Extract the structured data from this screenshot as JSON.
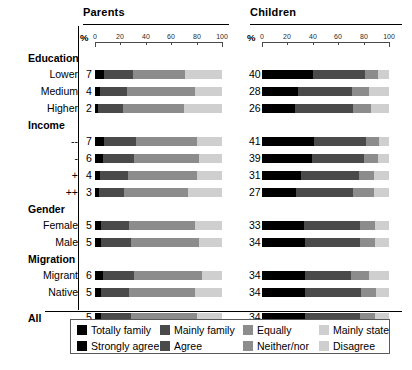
{
  "panels": [
    {
      "title": "Parents",
      "axis_unit": "%"
    },
    {
      "title": "Children",
      "axis_unit": "%"
    }
  ],
  "axis": {
    "unit": "%",
    "ticks": [
      0,
      20,
      40,
      60,
      80,
      100
    ],
    "tick_labels": [
      "0",
      "20",
      "40",
      "60",
      "80",
      "100"
    ],
    "min": 0,
    "max": 100
  },
  "legend": {
    "rows": [
      [
        {
          "label": "Totally family",
          "color": "#000000"
        },
        {
          "label": "Mainly family",
          "color": "#4a4a4a"
        },
        {
          "label": "Equally",
          "color": "#8c8c8c"
        },
        {
          "label": "Mainly state",
          "color": "#cfcfcf"
        }
      ],
      [
        {
          "label": "Strongly agree",
          "color": "#000000"
        },
        {
          "label": "Agree",
          "color": "#4a4a4a"
        },
        {
          "label": "Neither/nor",
          "color": "#8c8c8c"
        },
        {
          "label": "Disagree",
          "color": "#cfcfcf"
        }
      ]
    ]
  },
  "groups": [
    {
      "name": "Education",
      "rows": [
        {
          "label": "Lower",
          "parents_value": "7",
          "children_value": "40"
        },
        {
          "label": "Medium",
          "parents_value": "4",
          "children_value": "28"
        },
        {
          "label": "Higher",
          "parents_value": "2",
          "children_value": "26"
        }
      ]
    },
    {
      "name": "Income",
      "rows": [
        {
          "label": "--",
          "parents_value": "7",
          "children_value": "41"
        },
        {
          "label": "-",
          "parents_value": "6",
          "children_value": "39"
        },
        {
          "label": "+",
          "parents_value": "4",
          "children_value": "31"
        },
        {
          "label": "++",
          "parents_value": "3",
          "children_value": "27"
        }
      ]
    },
    {
      "name": "Gender",
      "rows": [
        {
          "label": "Female",
          "parents_value": "5",
          "children_value": "33"
        },
        {
          "label": "Male",
          "parents_value": "5",
          "children_value": "34"
        }
      ]
    },
    {
      "name": "Migration",
      "rows": [
        {
          "label": "Migrant",
          "parents_value": "6",
          "children_value": "34"
        },
        {
          "label": "Native",
          "parents_value": "5",
          "children_value": "34"
        }
      ]
    },
    {
      "name": "All",
      "is_total": true,
      "rows": [
        {
          "label": "",
          "parents_value": "5",
          "children_value": "34"
        }
      ]
    }
  ],
  "chart_data": {
    "type": "bar",
    "orientation": "horizontal",
    "stacked": true,
    "stack_mode": "percent",
    "title": "",
    "xlabel": "%",
    "ylabel": "",
    "xlim": [
      0,
      100
    ],
    "xticks": [
      0,
      20,
      40,
      60,
      80,
      100
    ],
    "grid": false,
    "legend_position": "bottom",
    "panels": [
      "Parents",
      "Children"
    ],
    "categories": [
      "Education: Lower",
      "Education: Medium",
      "Education: Higher",
      "Income: --",
      "Income: -",
      "Income: +",
      "Income: ++",
      "Gender: Female",
      "Gender: Male",
      "Migration: Migrant",
      "Migration: Native",
      "All"
    ],
    "series_parents": [
      {
        "name": "Totally family",
        "color": "#000000",
        "values": [
          7,
          4,
          2,
          7,
          6,
          4,
          3,
          5,
          5,
          6,
          5,
          5
        ]
      },
      {
        "name": "Mainly family",
        "color": "#4a4a4a",
        "values": [
          23,
          21,
          20,
          25,
          25,
          22,
          20,
          22,
          23,
          25,
          22,
          23
        ]
      },
      {
        "name": "Equally",
        "color": "#8c8c8c",
        "values": [
          41,
          54,
          48,
          48,
          51,
          54,
          50,
          52,
          54,
          53,
          52,
          52
        ]
      },
      {
        "name": "Mainly state",
        "color": "#cfcfcf",
        "values": [
          29,
          21,
          30,
          20,
          18,
          20,
          27,
          21,
          18,
          16,
          21,
          20
        ]
      }
    ],
    "series_children": [
      {
        "name": "Strongly agree",
        "color": "#000000",
        "values": [
          40,
          28,
          26,
          41,
          39,
          31,
          27,
          33,
          34,
          34,
          34,
          34
        ]
      },
      {
        "name": "Agree",
        "color": "#4a4a4a",
        "values": [
          41,
          43,
          46,
          41,
          41,
          45,
          45,
          44,
          43,
          36,
          44,
          43
        ]
      },
      {
        "name": "Neither/nor",
        "color": "#8c8c8c",
        "values": [
          10,
          13,
          14,
          10,
          11,
          12,
          16,
          12,
          12,
          14,
          12,
          12
        ]
      },
      {
        "name": "Disagree",
        "color": "#cfcfcf",
        "values": [
          9,
          16,
          14,
          8,
          9,
          12,
          12,
          11,
          11,
          16,
          10,
          11
        ]
      }
    ]
  }
}
